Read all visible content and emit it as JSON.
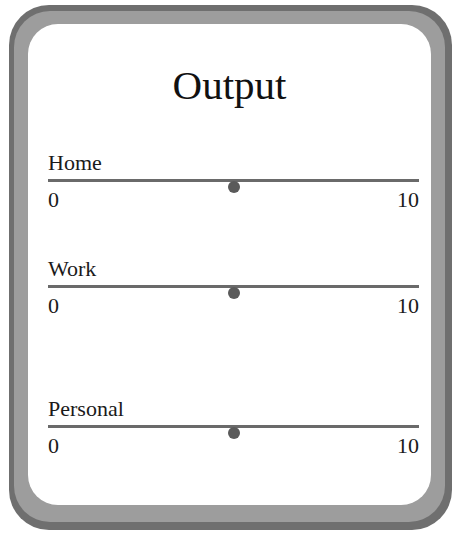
{
  "panel": {
    "title": "Output"
  },
  "sliders": [
    {
      "label": "Home",
      "min": "0",
      "max": "10",
      "value": 5
    },
    {
      "label": "Work",
      "min": "0",
      "max": "10",
      "value": 5
    },
    {
      "label": "Personal",
      "min": "0",
      "max": "10",
      "value": 5
    }
  ],
  "colors": {
    "frame_outer": "#6f6f6f",
    "frame_inner": "#9d9d9d",
    "panel_bg": "#ffffff",
    "track": "#6a6a6a",
    "thumb": "#5a5a5a",
    "text": "#111111"
  }
}
